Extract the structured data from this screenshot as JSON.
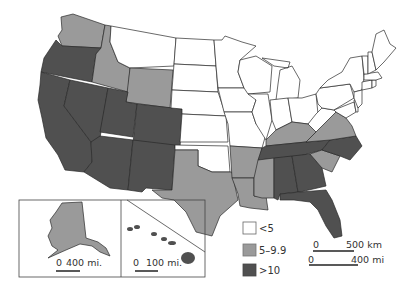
{
  "map": {
    "type": "choropleth",
    "region": "United States",
    "colors": {
      "low": "#ffffff",
      "mid": "#9a9a9a",
      "high": "#505050",
      "border": "#2a2a2a"
    },
    "legend": [
      {
        "label": "<5",
        "class": "low",
        "color": "#ffffff"
      },
      {
        "label": "5–9.9",
        "class": "mid",
        "color": "#9a9a9a"
      },
      {
        "label": ">10",
        "class": "high",
        "color": "#505050"
      }
    ],
    "scale_bars": {
      "main_km": {
        "start": "0",
        "end": "500 km"
      },
      "main_mi": {
        "start": "0",
        "end": "400 mi"
      },
      "alaska": {
        "start": "0",
        "end": "400 mi."
      },
      "hawaii": {
        "start": "0",
        "end": "100 mi."
      }
    },
    "states": {
      "Washington": "mid",
      "Oregon": "high",
      "California": "high",
      "Idaho": "mid",
      "Nevada": "high",
      "Montana": "low",
      "Wyoming": "mid",
      "Utah": "high",
      "Colorado": "high",
      "Arizona": "high",
      "New Mexico": "high",
      "North Dakota": "low",
      "South Dakota": "low",
      "Nebraska": "low",
      "Kansas": "low",
      "Oklahoma": "low",
      "Texas": "mid",
      "Minnesota": "low",
      "Iowa": "low",
      "Missouri": "low",
      "Arkansas": "mid",
      "Louisiana": "mid",
      "Wisconsin": "low",
      "Illinois": "low",
      "Michigan": "low",
      "Indiana": "low",
      "Ohio": "low",
      "Kentucky": "mid",
      "Tennessee": "high",
      "Mississippi": "mid",
      "Alabama": "high",
      "Georgia": "high",
      "Florida": "high",
      "South Carolina": "mid",
      "North Carolina": "high",
      "Virginia": "mid",
      "West Virginia": "low",
      "Pennsylvania": "low",
      "New York": "low",
      "Maryland": "low",
      "Delaware": "low",
      "New Jersey": "low",
      "Connecticut": "low",
      "Rhode Island": "low",
      "Massachusetts": "low",
      "Vermont": "low",
      "New Hampshire": "low",
      "Maine": "low",
      "Alaska": "mid",
      "Hawaii": "high"
    }
  }
}
